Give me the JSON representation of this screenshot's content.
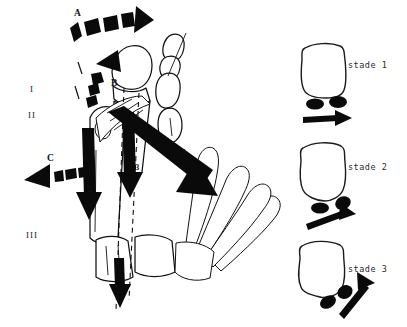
{
  "figure": {
    "background_color": "#ffffff",
    "ink_color": "#0a0a0a"
  },
  "left_panel": {
    "name": "hand-anatomy-diagram",
    "roman_numerals": [
      {
        "label": "I",
        "x": 30,
        "y": 92
      },
      {
        "label": "II",
        "x": 28,
        "y": 118
      },
      {
        "label": "III",
        "x": 26,
        "y": 235
      }
    ],
    "force_arrows": [
      {
        "label": "A",
        "direction": "right",
        "style": "segmented",
        "x": 78,
        "y": 20
      },
      {
        "label": "B",
        "direction": "up-curved",
        "style": "segmented",
        "x": 113,
        "y": 83
      },
      {
        "label": "C",
        "direction": "left",
        "style": "segmented",
        "x": 49,
        "y": 162
      }
    ],
    "vector_arrows": [
      {
        "label": "1",
        "direction": "down-right",
        "x": 184,
        "y": 155
      },
      {
        "label": "2",
        "direction": "down",
        "x": 91,
        "y": 190
      },
      {
        "label": "3",
        "direction": "down",
        "x": 136,
        "y": 170
      }
    ]
  },
  "right_panel": {
    "name": "stage-sequence",
    "stages": [
      {
        "label": "stade 1",
        "arrow_direction": "right-horizontal",
        "sesamoid_arrangement": "side-by-side"
      },
      {
        "label": "stade 2",
        "arrow_direction": "right-tilted",
        "sesamoid_arrangement": "offset-tilted"
      },
      {
        "label": "stade 3",
        "arrow_direction": "up-right-diagonal",
        "sesamoid_arrangement": "stacked-diagonal"
      }
    ]
  }
}
